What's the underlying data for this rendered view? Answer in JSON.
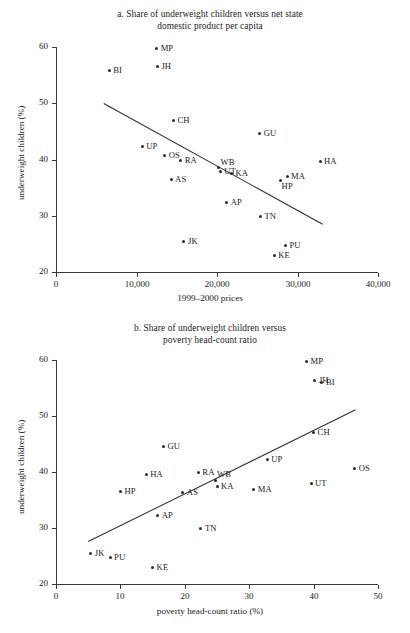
{
  "figure": {
    "ylabel": "underweight children (%)",
    "ytick_labels": [
      "60",
      "50",
      "40",
      "30",
      "20"
    ]
  },
  "panel_a": {
    "title_line1": "a. Share of underweight children versus net state",
    "title_line2": "domestic product per capita",
    "xlabel": "1999–2000 prices",
    "xtick_labels": [
      "0",
      "10,000",
      "20,000",
      "30,000",
      "40,000"
    ]
  },
  "panel_b": {
    "title_line1": "b. Share of underweight children versus",
    "title_line2": "poverty head-count ratio",
    "xlabel": "poverty head-count ratio (%)",
    "xtick_labels": [
      "0",
      "10",
      "20",
      "30",
      "40",
      "50"
    ]
  },
  "chart_data": [
    {
      "type": "scatter",
      "id": "panel-a",
      "title": "a. Share of underweight children versus net state domestic product per capita",
      "xlabel": "1999–2000 prices",
      "ylabel": "underweight children (%)",
      "xlim": [
        0,
        40000
      ],
      "ylim": [
        20,
        60
      ],
      "xticks": [
        0,
        10000,
        20000,
        30000,
        40000
      ],
      "yticks": [
        20,
        30,
        40,
        50,
        60
      ],
      "grid": false,
      "legend": "none",
      "point_label_field": "state",
      "points": [
        {
          "state": "MP",
          "x": 12500,
          "y": 59.8,
          "label_side": "right"
        },
        {
          "state": "BI",
          "x": 6600,
          "y": 55.9,
          "label_side": "right"
        },
        {
          "state": "JH",
          "x": 12600,
          "y": 56.5,
          "label_side": "right"
        },
        {
          "state": "CH",
          "x": 14600,
          "y": 47.0,
          "label_side": "right"
        },
        {
          "state": "GU",
          "x": 25300,
          "y": 44.6,
          "label_side": "right"
        },
        {
          "state": "UP",
          "x": 10700,
          "y": 42.3,
          "label_side": "right"
        },
        {
          "state": "OS",
          "x": 13500,
          "y": 40.7,
          "label_side": "right"
        },
        {
          "state": "RA",
          "x": 15500,
          "y": 39.9,
          "label_side": "right"
        },
        {
          "state": "HA",
          "x": 32800,
          "y": 39.6,
          "label_side": "right"
        },
        {
          "state": "WB",
          "x": 20200,
          "y": 38.5,
          "label_side": "up-right"
        },
        {
          "state": "UT",
          "x": 20400,
          "y": 37.9,
          "label_side": "right"
        },
        {
          "state": "KA",
          "x": 21800,
          "y": 37.5,
          "label_side": "right"
        },
        {
          "state": "MA",
          "x": 28700,
          "y": 36.9,
          "label_side": "right"
        },
        {
          "state": "AS",
          "x": 14300,
          "y": 36.4,
          "label_side": "right"
        },
        {
          "state": "HP",
          "x": 27900,
          "y": 36.3,
          "label_side": "down-right"
        },
        {
          "state": "AP",
          "x": 21200,
          "y": 32.3,
          "label_side": "right"
        },
        {
          "state": "TN",
          "x": 25400,
          "y": 29.9,
          "label_side": "right"
        },
        {
          "state": "JK",
          "x": 15900,
          "y": 25.5,
          "label_side": "right"
        },
        {
          "state": "PU",
          "x": 28500,
          "y": 24.8,
          "label_side": "right"
        },
        {
          "state": "KE",
          "x": 27100,
          "y": 22.9,
          "label_side": "right"
        }
      ],
      "trendline": {
        "x0": 6000,
        "y0": 50.1,
        "x1": 33200,
        "y1": 28.6
      }
    },
    {
      "type": "scatter",
      "id": "panel-b",
      "title": "b. Share of underweight children versus poverty head-count ratio",
      "xlabel": "poverty head-count ratio (%)",
      "ylabel": "underweight children (%)",
      "xlim": [
        0,
        50
      ],
      "ylim": [
        20,
        60
      ],
      "xticks": [
        0,
        10,
        20,
        30,
        40,
        50
      ],
      "yticks": [
        20,
        30,
        40,
        50,
        60
      ],
      "grid": false,
      "legend": "none",
      "point_label_field": "state",
      "points": [
        {
          "state": "MP",
          "x": 38.9,
          "y": 59.8,
          "label_side": "right"
        },
        {
          "state": "JH",
          "x": 40.2,
          "y": 56.4,
          "label_side": "right"
        },
        {
          "state": "BI",
          "x": 41.3,
          "y": 55.9,
          "label_side": "right"
        },
        {
          "state": "CH",
          "x": 40.0,
          "y": 47.0,
          "label_side": "right"
        },
        {
          "state": "GU",
          "x": 16.7,
          "y": 44.6,
          "label_side": "right"
        },
        {
          "state": "UP",
          "x": 32.8,
          "y": 42.3,
          "label_side": "right"
        },
        {
          "state": "OS",
          "x": 46.4,
          "y": 40.7,
          "label_side": "right"
        },
        {
          "state": "RA",
          "x": 22.1,
          "y": 39.9,
          "label_side": "right"
        },
        {
          "state": "HA",
          "x": 14.0,
          "y": 39.6,
          "label_side": "right"
        },
        {
          "state": "WB",
          "x": 24.7,
          "y": 38.5,
          "label_side": "up-right"
        },
        {
          "state": "UT",
          "x": 39.6,
          "y": 37.9,
          "label_side": "right"
        },
        {
          "state": "KA",
          "x": 25.0,
          "y": 37.5,
          "label_side": "right"
        },
        {
          "state": "MA",
          "x": 30.7,
          "y": 36.9,
          "label_side": "right"
        },
        {
          "state": "HP",
          "x": 10.0,
          "y": 36.5,
          "label_side": "right"
        },
        {
          "state": "AS",
          "x": 19.7,
          "y": 36.3,
          "label_side": "right"
        },
        {
          "state": "AP",
          "x": 15.8,
          "y": 32.3,
          "label_side": "right"
        },
        {
          "state": "TN",
          "x": 22.5,
          "y": 29.9,
          "label_side": "right"
        },
        {
          "state": "JK",
          "x": 5.4,
          "y": 25.5,
          "label_side": "right"
        },
        {
          "state": "PU",
          "x": 8.4,
          "y": 24.8,
          "label_side": "right"
        },
        {
          "state": "KE",
          "x": 15.0,
          "y": 22.9,
          "label_side": "right"
        }
      ],
      "trendline": {
        "x0": 5.0,
        "y0": 27.7,
        "x1": 46.5,
        "y1": 51.2
      }
    }
  ]
}
